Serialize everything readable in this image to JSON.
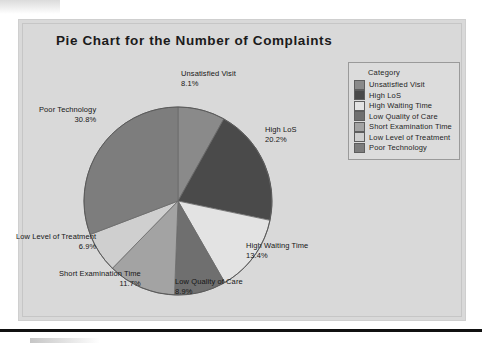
{
  "chart_data": {
    "type": "pie",
    "title": "Pie Chart for the Number of Complaints",
    "legend_title": "Category",
    "legend_position": "top-right",
    "categories": [
      "Unsatisfied Visit",
      "High LoS",
      "High Waiting Time",
      "Low Quality of Care",
      "Short Examination Time",
      "Low Level of Treatment",
      "Poor Technology"
    ],
    "values": [
      8.1,
      20.2,
      13.4,
      8.9,
      11.7,
      6.9,
      30.8
    ],
    "value_labels": [
      "8.1%",
      "20.2%",
      "13.4%",
      "8.9%",
      "11.7%",
      "6.9%",
      "30.8%"
    ],
    "unit": "%",
    "start_angle_deg": 0,
    "direction": "clockwise",
    "colors": [
      "#8a8a8a",
      "#4a4a4a",
      "#e3e3e3",
      "#6f6f6f",
      "#a3a3a3",
      "#cfcfcf",
      "#7d7d7d"
    ],
    "slices": [
      {
        "label": "Unsatisfied Visit",
        "pct": "8.1%",
        "value": 8.1,
        "color": "#8a8a8a"
      },
      {
        "label": "High LoS",
        "pct": "20.2%",
        "value": 20.2,
        "color": "#4a4a4a"
      },
      {
        "label": "High Waiting Time",
        "pct": "13.4%",
        "value": 13.4,
        "color": "#e3e3e3"
      },
      {
        "label": "Low Quality of Care",
        "pct": "8.9%",
        "value": 8.9,
        "color": "#6f6f6f"
      },
      {
        "label": "Short Examination Time",
        "pct": "11.7%",
        "value": 11.7,
        "color": "#a3a3a3"
      },
      {
        "label": "Low Level of Treatment",
        "pct": "6.9%",
        "value": 6.9,
        "color": "#cfcfcf"
      },
      {
        "label": "Poor Technology",
        "pct": "30.8%",
        "value": 30.8,
        "color": "#7d7d7d"
      }
    ]
  },
  "panel": {
    "background_color": "#d9d9d9",
    "title_color": "#1b1b1b"
  }
}
